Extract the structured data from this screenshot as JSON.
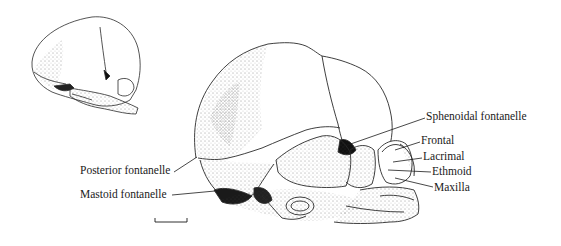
{
  "figure": {
    "labels": {
      "sphenoidal_fontanelle": "Sphenoidal fontanelle",
      "frontal": "Frontal",
      "lacrimal": "Lacrimal",
      "ethmoid": "Ethmoid",
      "maxilla": "Maxilla",
      "posterior_fontanelle": "Posterior fontanelle",
      "mastoid_fontanelle": "Mastoid fontanelle"
    },
    "scale_bar": "scale bar (unlabeled)",
    "colors": {
      "ink": "#1a1a1a",
      "background": "#ffffff"
    }
  }
}
